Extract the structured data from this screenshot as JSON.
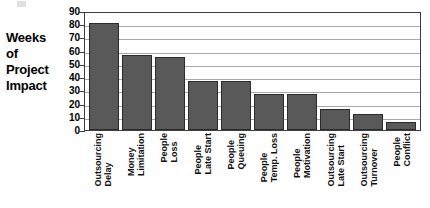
{
  "axis_caption": {
    "lines": [
      "Weeks",
      "of",
      "Project",
      "Impact"
    ]
  },
  "chart_data": {
    "type": "bar",
    "title": "",
    "xlabel": "",
    "ylabel": "Weeks of Project Impact",
    "ylim": [
      0,
      90
    ],
    "ytick_step": 10,
    "yticks": [
      90,
      80,
      70,
      60,
      50,
      40,
      30,
      20,
      10,
      0
    ],
    "ytick_labels": [
      "90",
      "80",
      "70",
      "60",
      "50",
      "40",
      "30",
      "20",
      "10",
      "0"
    ],
    "grid": true,
    "legend": false,
    "bar_color": "#595959",
    "bar_edge_color": "#2b2b2b",
    "categories": [
      "Outsourcing Delay",
      "Money Limitation",
      "People Loss",
      "People Late Start",
      "People Queuing",
      "People Temp. Loss",
      "People Motivation",
      "Outsourcing Late Start",
      "Outsourcing Turnover",
      "People Conflict"
    ],
    "category_lines": [
      [
        "Outsourcing",
        "Delay"
      ],
      [
        "Money",
        "Limitation"
      ],
      [
        "People",
        "Loss"
      ],
      [
        "People",
        "Late Start"
      ],
      [
        "People",
        "Queuing"
      ],
      [
        "People",
        "Temp. Loss"
      ],
      [
        "People",
        "Motivation"
      ],
      [
        "Outsourcing",
        "Late Start"
      ],
      [
        "Outsourcing",
        "Turnover"
      ],
      [
        "People",
        "Conflict"
      ]
    ],
    "values": [
      81,
      57,
      55,
      37,
      37,
      27,
      27,
      16,
      12,
      6
    ]
  }
}
